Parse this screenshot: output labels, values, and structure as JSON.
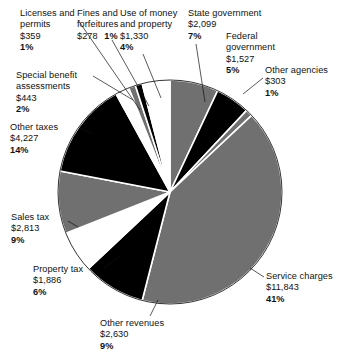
{
  "chart_data": {
    "type": "pie",
    "title": "",
    "center": {
      "x": 170,
      "y": 192
    },
    "radius": 112,
    "start_angle_deg": -90,
    "direction": "clockwise",
    "legend": "none",
    "grid": false,
    "unit": "$ millions",
    "colors": {
      "gray": "#707070",
      "black": "#000000",
      "white": "#ffffff",
      "separator": "#ffffff",
      "outline": "#000000",
      "text": "#111111"
    },
    "categories": [
      "State government",
      "Federal government",
      "Other agencies",
      "Service charges",
      "Other revenues",
      "Property tax",
      "Sales tax",
      "Other taxes",
      "Special benefit assessments",
      "Licenses and permits",
      "Fines and forfeitures",
      "Use of money and property"
    ],
    "values": [
      2099,
      1527,
      303,
      11843,
      2630,
      1886,
      2813,
      4227,
      443,
      359,
      278,
      1330
    ],
    "percents": [
      7,
      5,
      1,
      41,
      9,
      6,
      9,
      14,
      2,
      1,
      1,
      4
    ],
    "slices": [
      {
        "name": "State government",
        "amount": "$2,099",
        "percent": "7%",
        "value": 2099,
        "pct": 7,
        "fill": "gray"
      },
      {
        "name": "Federal government",
        "amount": "$1,527",
        "percent": "5%",
        "value": 1527,
        "pct": 5,
        "fill": "black"
      },
      {
        "name": "Other agencies",
        "amount": "$303",
        "percent": "1%",
        "value": 303,
        "pct": 1,
        "fill": "gray"
      },
      {
        "name": "Service charges",
        "amount": "$11,843",
        "percent": "41%",
        "value": 11843,
        "pct": 41,
        "fill": "gray"
      },
      {
        "name": "Other revenues",
        "amount": "$2,630",
        "percent": "9%",
        "value": 2630,
        "pct": 9,
        "fill": "black"
      },
      {
        "name": "Property tax",
        "amount": "$1,886",
        "percent": "6%",
        "value": 1886,
        "pct": 6,
        "fill": "white"
      },
      {
        "name": "Sales tax",
        "amount": "$2,813",
        "percent": "9%",
        "value": 2813,
        "pct": 9,
        "fill": "gray"
      },
      {
        "name": "Other taxes",
        "amount": "$4,227",
        "percent": "14%",
        "value": 4227,
        "pct": 14,
        "fill": "black"
      },
      {
        "name": "Special benefit assessments",
        "amount": "$443",
        "percent": "2%",
        "value": 443,
        "pct": 2,
        "fill": "white"
      },
      {
        "name": "Licenses and permits",
        "amount": "$359",
        "percent": "1%",
        "value": 359,
        "pct": 1,
        "fill": "gray"
      },
      {
        "name": "Fines and forfeitures",
        "amount": "$278",
        "percent": "1%",
        "value": 278,
        "pct": 1,
        "fill": "black"
      },
      {
        "name": "Use of money and property",
        "amount": "$1,330",
        "percent": "4%",
        "value": 1330,
        "pct": 4,
        "fill": "white"
      }
    ]
  },
  "labels": {
    "licenses": {
      "line1": "Licenses and",
      "line2": "permits",
      "amount": "$359",
      "percent": "1%"
    },
    "fines": {
      "line1": "Fines and",
      "line2": "forfeitures",
      "amount": "$278",
      "percent": "1%"
    },
    "use_of_money": {
      "line1": "Use of money",
      "line2": "and property",
      "amount": "$1,330",
      "percent": "4%"
    },
    "state_gov": {
      "line1": "State government",
      "amount": "$2,099",
      "percent": "7%"
    },
    "federal_gov": {
      "line1": "Federal",
      "line2": "government",
      "amount": "$1,527",
      "percent": "5%"
    },
    "other_agencies": {
      "line1": "Other agencies",
      "amount": "$303",
      "percent": "1%"
    },
    "special": {
      "line1": "Special benefit",
      "line2": "assessments",
      "amount": "$443",
      "percent": "2%"
    },
    "other_taxes": {
      "line1": "Other taxes",
      "amount": "$4,227",
      "percent": "14%"
    },
    "sales_tax": {
      "line1": "Sales tax",
      "amount": "$2,813",
      "percent": "9%"
    },
    "property_tax": {
      "line1": "Property tax",
      "amount": "$1,886",
      "percent": "6%"
    },
    "other_revenues": {
      "line1": "Other revenues",
      "amount": "$2,630",
      "percent": "9%"
    },
    "service_charges": {
      "line1": "Service charges",
      "amount": "$11,843",
      "percent": "41%"
    }
  }
}
